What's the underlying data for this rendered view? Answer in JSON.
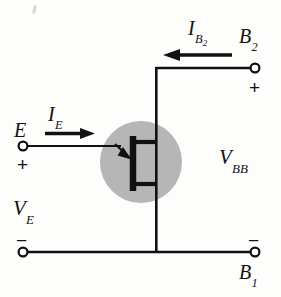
{
  "figure": {
    "kind": "ujt-circuit-schematic",
    "background_color": "#fdfdfc",
    "ink_color": "#111111",
    "device_highlight_color": "#b6b6b6"
  },
  "labels": {
    "emitter_terminal": "E",
    "emitter_current": {
      "base": "I",
      "sub": "E"
    },
    "emitter_voltage": {
      "base": "V",
      "sub": "E"
    },
    "base2_terminal": {
      "base": "B",
      "sub": "2"
    },
    "base2_current": {
      "base": "I",
      "sub": "B",
      "sub2": "2"
    },
    "base1_terminal": {
      "base": "B",
      "sub": "1"
    },
    "supply_voltage": {
      "base": "V",
      "sub": "BB"
    }
  },
  "polarity_marks": {
    "emitter_plus": "+",
    "emitter_minus": "−",
    "base2_plus": "+",
    "base1_minus": "−"
  },
  "terminals": [
    {
      "name": "E",
      "x": 23,
      "y": 146
    },
    {
      "name": "B2",
      "x": 255,
      "y": 68
    },
    {
      "name": "B1-left",
      "x": 23,
      "y": 252
    },
    {
      "name": "B1-right",
      "x": 255,
      "y": 252
    }
  ],
  "current_arrows": [
    {
      "name": "IE",
      "direction": "right",
      "x1": 45,
      "y1": 134,
      "x2": 93,
      "y2": 134
    },
    {
      "name": "IB2",
      "direction": "left",
      "x1": 232,
      "y1": 55,
      "x2": 163,
      "y2": 55
    }
  ],
  "device": {
    "type": "unijunction-transistor",
    "highlight_center_x": 141,
    "highlight_center_y": 162,
    "highlight_radius": 41
  }
}
